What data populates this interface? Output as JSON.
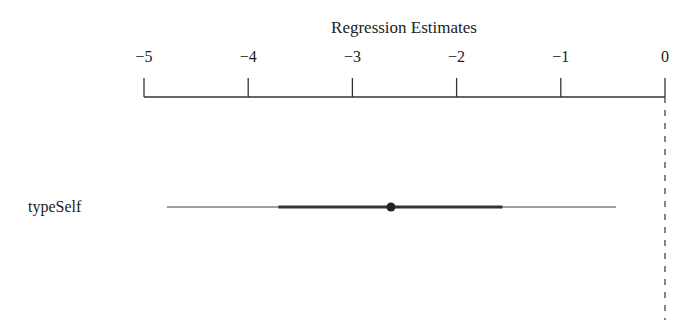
{
  "chart_data": {
    "type": "coefficient-plot",
    "title": "Regression Estimates",
    "xlabel": "Regression Estimates",
    "ylabel": "",
    "xlim": [
      -5,
      0
    ],
    "ticks": [
      -5,
      -4,
      -3,
      -2,
      -1,
      0
    ],
    "tick_labels": [
      "−5",
      "−4",
      "−3",
      "−2",
      "−1",
      "0"
    ],
    "reference_line": {
      "x": 0,
      "style": "dashed"
    },
    "grid": false,
    "legend": null,
    "series": [
      {
        "name": "typeSelf",
        "estimate": -2.63,
        "inner_interval": [
          -3.71,
          -1.56
        ],
        "outer_interval": [
          -4.78,
          -0.47
        ]
      }
    ]
  },
  "colors": {
    "line": "#333333",
    "text": "#222222",
    "background": "#ffffff"
  }
}
